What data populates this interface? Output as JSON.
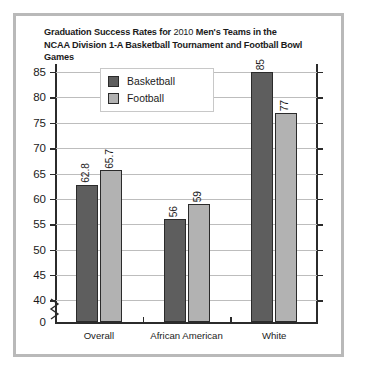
{
  "chart_data": {
    "type": "bar",
    "title": "Graduation Success Rates for 2010 Men's Teams in the NCAA Division 1-A Basketball Tournament and Football Bowl Games",
    "title_line1_a": "Graduation Success Rates for ",
    "title_line1_b": "2010",
    "title_line1_c": " Men's Teams in the",
    "title_line2": "NCAA Division 1-A Basketball Tournament and Football Bowl Games",
    "xlabel": "",
    "ylabel": "",
    "categories": [
      "Overall",
      "African American",
      "White"
    ],
    "series": [
      {
        "name": "Basketball",
        "color": "#5e5e5e",
        "values": [
          62.8,
          56,
          85
        ],
        "labels": [
          "62.8",
          "56",
          "85"
        ]
      },
      {
        "name": "Football",
        "color": "#b2b2b2",
        "values": [
          65.7,
          59,
          77
        ],
        "labels": [
          "65.7",
          "59",
          "77"
        ]
      }
    ],
    "ylim": [
      40,
      87.5
    ],
    "yticks": [
      "85",
      "80",
      "75",
      "70",
      "65",
      "60",
      "55",
      "50",
      "45",
      "40",
      "0"
    ],
    "ytick_values": [
      85,
      80,
      75,
      70,
      65,
      60,
      55,
      50,
      45,
      40
    ],
    "axis_break": true,
    "axis_break_label": "0",
    "grid": true,
    "legend": {
      "position": "top-left",
      "entries": [
        "Basketball",
        "Football"
      ]
    }
  }
}
